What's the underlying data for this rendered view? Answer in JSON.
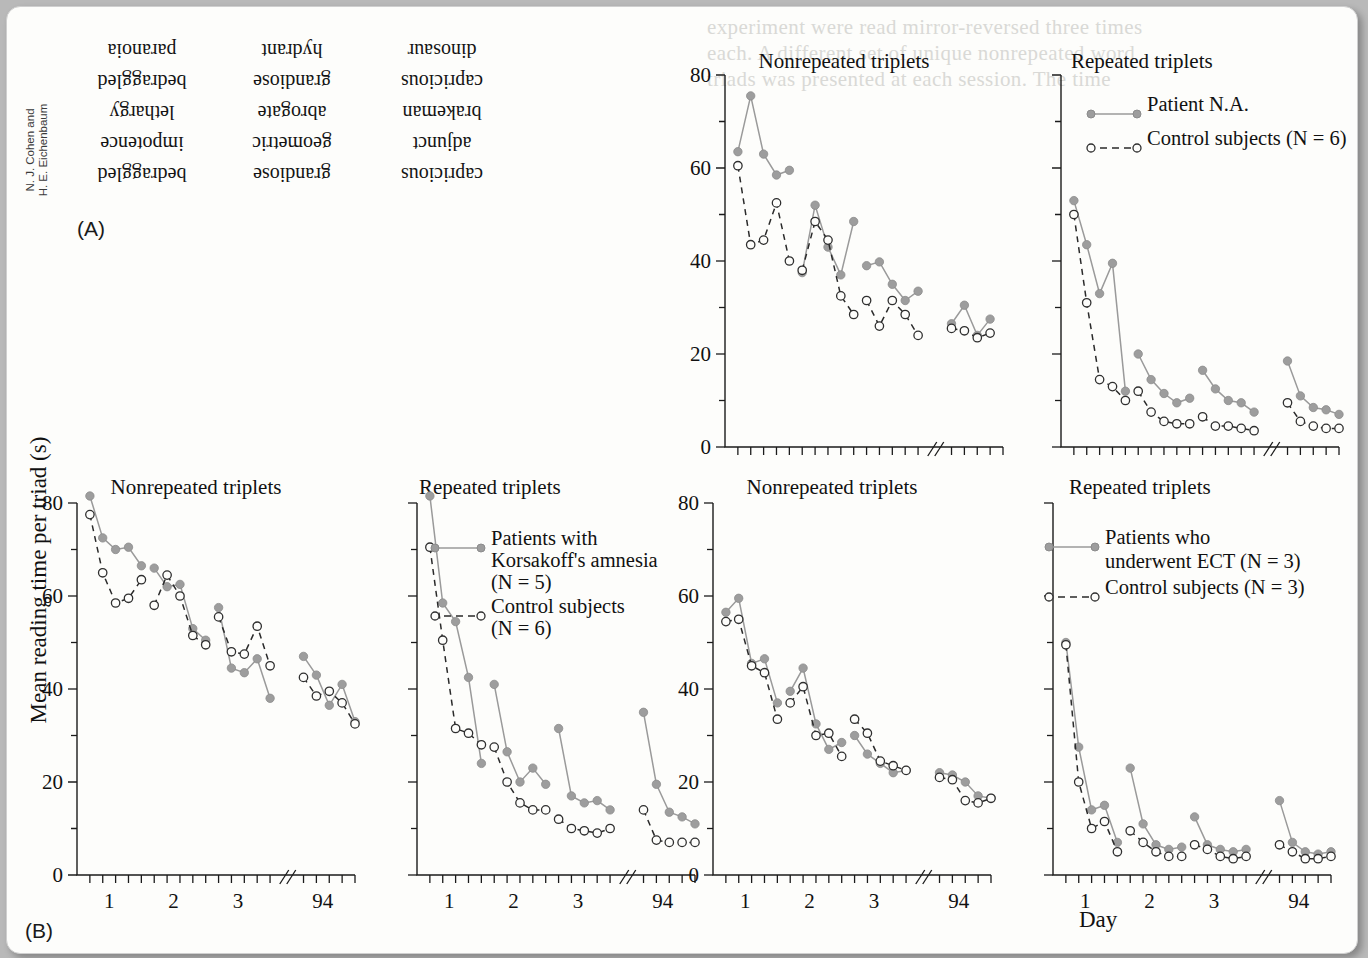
{
  "page": {
    "credit_line1": "N. J. Cohen and",
    "credit_line2": "H. E. Eichenbaum",
    "label_a": "(A)",
    "label_b": "(B)",
    "background_bleed": [
      "experiment were read mirror-reversed three times",
      "each. A different set of unique nonrepeated word",
      "triads was presented at each session. The time"
    ]
  },
  "panel_a": {
    "caption": "mirror-reversed word triads",
    "rows": [
      [
        "capricious",
        "grandiose",
        "bedraggled"
      ],
      [
        "adjunct",
        "geometric",
        "impotence"
      ],
      [
        "brakeman",
        "abrogate",
        "lethargy"
      ],
      [
        "capricious",
        "grandiose",
        "bedraggled"
      ],
      [
        "dinosaur",
        "hydrant",
        "paranoia"
      ]
    ]
  },
  "axes": {
    "ylabel": "Mean reading time per triad (s)",
    "xlabel": "Day",
    "yticks": [
      0,
      20,
      40,
      60,
      80
    ],
    "ylim": [
      0,
      80
    ],
    "xtick_labels": [
      "1",
      "2",
      "3",
      "94"
    ],
    "axis_break": true
  },
  "colors": {
    "patient_marker": "#9d9d9d",
    "patient_line": "#9a9a9a",
    "control_marker": "#fdfdfb",
    "control_line": "#2a2a2a",
    "axis": "#1b1b1b",
    "page": "#fdfdfb"
  },
  "chart_data": [
    {
      "id": "na-nonrepeated",
      "type": "line",
      "title": "Nonrepeated triplets",
      "xlabel": "",
      "ylabel": "Mean reading time per triad (s)",
      "ylim": [
        0,
        80
      ],
      "yticks": [
        0,
        20,
        40,
        60,
        80
      ],
      "xtick_labels": [
        "",
        "",
        "",
        ""
      ],
      "grid": false,
      "legend": null,
      "series": [
        {
          "name": "Patient N.A.",
          "marker": "filled-circle",
          "line": "solid",
          "x": [
            1,
            2,
            3,
            4,
            5,
            6,
            7,
            8,
            9,
            10,
            11,
            12,
            13,
            14,
            15,
            16,
            17,
            18,
            19,
            20,
            21,
            22
          ],
          "values": [
            63.5,
            75.5,
            63.0,
            58.5,
            59.5,
            37.5,
            52.0,
            43.0,
            37.0,
            48.5,
            39.0,
            39.8,
            35.0,
            31.5,
            33.5,
            26.5,
            30.5,
            24.0,
            27.5,
            null,
            null,
            null
          ]
        },
        {
          "name": "Control subjects (N = 6)",
          "marker": "open-circle",
          "line": "dashed",
          "x": [
            1,
            2,
            3,
            4,
            5,
            6,
            7,
            8,
            9,
            10,
            11,
            12,
            13,
            14,
            15,
            16,
            17,
            18,
            19,
            20,
            21,
            22
          ],
          "values": [
            60.5,
            43.5,
            44.5,
            52.5,
            40.0,
            38.0,
            48.5,
            44.5,
            32.5,
            28.5,
            31.5,
            26.0,
            31.5,
            28.5,
            24.0,
            25.5,
            25.0,
            23.5,
            24.5,
            null,
            null,
            null
          ]
        }
      ]
    },
    {
      "id": "na-repeated",
      "type": "line",
      "title": "Repeated triplets",
      "ylim": [
        0,
        80
      ],
      "yticks": [
        0,
        20,
        40,
        60,
        80
      ],
      "grid": false,
      "legend": {
        "position": "top-right",
        "entries": [
          "Patient N.A.",
          "Control subjects (N = 6)"
        ]
      },
      "series": [
        {
          "name": "Patient N.A.",
          "marker": "filled-circle",
          "line": "solid",
          "values": [
            53.0,
            43.5,
            33.0,
            39.5,
            12.0,
            20.0,
            14.5,
            11.5,
            9.5,
            10.5,
            16.5,
            12.5,
            10.0,
            9.5,
            7.5,
            18.5,
            11.0,
            8.5,
            8.0,
            7.0
          ]
        },
        {
          "name": "Control subjects (N = 6)",
          "marker": "open-circle",
          "line": "dashed",
          "values": [
            50.0,
            31.0,
            14.5,
            13.0,
            10.0,
            12.0,
            7.5,
            5.5,
            5.0,
            5.0,
            6.5,
            4.5,
            4.5,
            4.0,
            3.5,
            9.5,
            5.5,
            4.5,
            4.0,
            4.0
          ]
        }
      ]
    },
    {
      "id": "korsakoff-nonrepeated",
      "type": "line",
      "title": "Nonrepeated triplets",
      "ylim": [
        0,
        80
      ],
      "yticks": [
        0,
        20,
        40,
        60,
        80
      ],
      "xtick_labels": [
        "1",
        "2",
        "3",
        "94"
      ],
      "grid": false,
      "legend": null,
      "series": [
        {
          "name": "Patients with Korsakoff's amnesia (N = 5)",
          "marker": "filled-circle",
          "line": "solid",
          "values": [
            81.5,
            72.5,
            70.0,
            70.5,
            66.5,
            66.0,
            62.0,
            62.5,
            53.0,
            50.5,
            57.5,
            44.5,
            43.5,
            46.5,
            38.0,
            47.0,
            43.0,
            36.5,
            41.0,
            33.0
          ]
        },
        {
          "name": "Control subjects (N = 6)",
          "marker": "open-circle",
          "line": "dashed",
          "values": [
            77.5,
            65.0,
            58.5,
            59.5,
            63.5,
            58.0,
            64.5,
            60.0,
            51.5,
            49.5,
            55.5,
            48.0,
            47.5,
            53.5,
            45.0,
            42.5,
            38.5,
            39.5,
            37.0,
            32.5
          ]
        }
      ]
    },
    {
      "id": "korsakoff-repeated",
      "type": "line",
      "title": "Repeated triplets",
      "ylim": [
        0,
        80
      ],
      "yticks": [
        0,
        20,
        40,
        60,
        80
      ],
      "xtick_labels": [
        "1",
        "2",
        "3",
        "94"
      ],
      "grid": false,
      "legend": {
        "position": "top-center",
        "entries": [
          "Patients with Korsakoff's amnesia (N = 5)",
          "Control subjects (N = 6)"
        ]
      },
      "series": [
        {
          "name": "Patients with Korsakoff's amnesia (N = 5)",
          "marker": "filled-circle",
          "line": "solid",
          "values": [
            81.5,
            58.5,
            54.5,
            42.5,
            24.0,
            41.0,
            26.5,
            20.0,
            23.0,
            19.5,
            31.5,
            17.0,
            15.5,
            16.0,
            14.0,
            35.0,
            19.5,
            13.5,
            12.5,
            11.0
          ]
        },
        {
          "name": "Control subjects (N = 6)",
          "marker": "open-circle",
          "line": "dashed",
          "values": [
            70.5,
            50.5,
            31.5,
            30.5,
            28.0,
            27.5,
            20.0,
            15.5,
            14.0,
            14.0,
            12.0,
            10.0,
            9.5,
            9.0,
            10.0,
            14.0,
            7.5,
            7.0,
            7.0,
            7.0
          ]
        }
      ]
    },
    {
      "id": "ect-nonrepeated",
      "type": "line",
      "title": "Nonrepeated triplets",
      "ylim": [
        0,
        80
      ],
      "yticks": [
        0,
        20,
        40,
        60,
        80
      ],
      "xtick_labels": [
        "1",
        "2",
        "3",
        "94"
      ],
      "grid": false,
      "legend": null,
      "series": [
        {
          "name": "Patients who underwent ECT (N = 3)",
          "marker": "filled-circle",
          "line": "solid",
          "values": [
            56.5,
            59.5,
            45.5,
            46.5,
            37.0,
            39.5,
            44.5,
            32.5,
            27.0,
            28.5,
            30.0,
            26.0,
            24.0,
            22.0,
            22.5,
            22.0,
            21.5,
            20.0,
            17.0,
            16.5
          ]
        },
        {
          "name": "Control subjects (N = 3)",
          "marker": "open-circle",
          "line": "dashed",
          "values": [
            54.5,
            55.0,
            45.0,
            43.5,
            33.5,
            37.0,
            40.5,
            30.0,
            30.5,
            25.5,
            33.5,
            30.5,
            24.5,
            23.5,
            22.5,
            21.0,
            20.5,
            16.0,
            15.5,
            16.5
          ]
        }
      ]
    },
    {
      "id": "ect-repeated",
      "type": "line",
      "title": "Repeated triplets",
      "ylim": [
        0,
        80
      ],
      "yticks": [
        0,
        20,
        40,
        60,
        80
      ],
      "xtick_labels": [
        "1",
        "2",
        "3",
        "94"
      ],
      "grid": false,
      "legend": {
        "position": "top-center",
        "entries": [
          "Patients who underwent ECT (N = 3)",
          "Control subjects (N = 3)"
        ]
      },
      "series": [
        {
          "name": "Patients who underwent ECT (N = 3)",
          "marker": "filled-circle",
          "line": "solid",
          "values": [
            50.0,
            27.5,
            14.0,
            15.0,
            7.0,
            23.0,
            11.0,
            6.5,
            5.5,
            6.0,
            12.5,
            6.5,
            5.5,
            5.0,
            5.5,
            16.0,
            7.0,
            5.0,
            4.5,
            5.0
          ]
        },
        {
          "name": "Control subjects (N = 3)",
          "marker": "open-circle",
          "line": "dashed",
          "values": [
            49.5,
            20.0,
            10.0,
            11.5,
            5.0,
            9.5,
            7.0,
            5.0,
            4.0,
            4.0,
            6.5,
            5.5,
            4.0,
            3.5,
            4.0,
            6.5,
            5.0,
            3.5,
            3.5,
            4.0
          ]
        }
      ]
    }
  ],
  "legends": {
    "na": {
      "patient": "Patient N.A.",
      "control": "Control subjects (N = 6)"
    },
    "korsakoff": {
      "patient_l1": "Patients with",
      "patient_l2": "Korsakoff's amnesia",
      "patient_l3": "(N = 5)",
      "control_l1": "Control subjects",
      "control_l2": "(N = 6)"
    },
    "ect": {
      "patient_l1": "Patients who",
      "patient_l2": "underwent ECT (N = 3)",
      "control_l1": "Control subjects (N = 3)"
    }
  }
}
